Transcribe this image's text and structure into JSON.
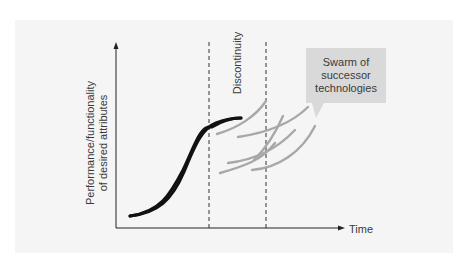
{
  "diagram": {
    "title": "",
    "y_axis_label_line1": "Performance/functionality",
    "y_axis_label_line2": "of desired attributes",
    "x_axis_label": "Time",
    "discontinuity_label": "Discontinuity",
    "callout": {
      "line1": "Swarm of",
      "line2": "successor",
      "line3": "technologies"
    },
    "colors": {
      "panel": "#f5f5f5",
      "main_curve": "#111111",
      "successor_curves": "#a8a8a8",
      "callout_fill": "#d9d9d9",
      "axis": "#222222",
      "dashed_lines": "#333333"
    },
    "elements": {
      "main_s_curve": "Incumbent technology S-curve rising from lower left and flattening near discontinuity",
      "successor_curves_count": 6,
      "dashed_lines_count": 2
    }
  }
}
